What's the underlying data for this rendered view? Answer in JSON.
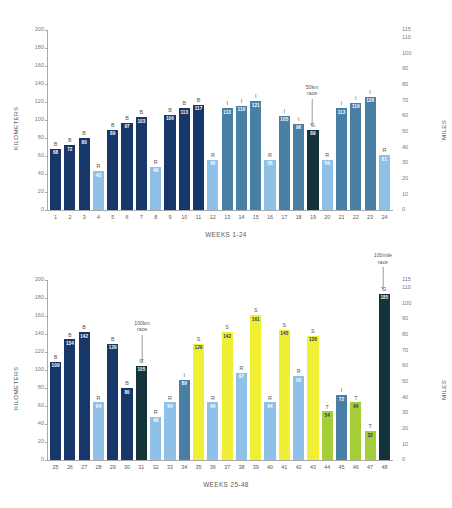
{
  "chart_data": [
    {
      "type": "bar",
      "id": "weeks-1-24",
      "title": "",
      "xlabel": "WEEKS 1-24",
      "ylabel": "KILOMETERS",
      "ylabel_right": "MILES",
      "ylim": [
        0,
        200
      ],
      "yticks": [
        0,
        20,
        40,
        60,
        80,
        100,
        120,
        140,
        160,
        180,
        200
      ],
      "ylim_right": [
        0,
        115
      ],
      "yticks_right": [
        0,
        10,
        20,
        30,
        40,
        50,
        60,
        70,
        80,
        90,
        100,
        110,
        115
      ],
      "grid": false,
      "legend": "none",
      "categories": [
        "1",
        "2",
        "3",
        "4",
        "5",
        "6",
        "7",
        "8",
        "9",
        "10",
        "11",
        "12",
        "13",
        "14",
        "15",
        "16",
        "17",
        "18",
        "19",
        "20",
        "21",
        "22",
        "23",
        "24"
      ],
      "values": [
        68,
        72,
        80,
        43,
        89,
        97,
        103,
        48,
        106,
        113,
        117,
        56,
        113,
        116,
        121,
        56,
        105,
        96,
        89,
        56,
        113,
        119,
        126,
        61
      ],
      "types": [
        "B",
        "B",
        "B",
        "R",
        "B",
        "B",
        "B",
        "R",
        "B",
        "B",
        "B",
        "R",
        "I",
        "I",
        "I",
        "R",
        "I",
        "I",
        "G",
        "R",
        "I",
        "I",
        "I",
        "R"
      ],
      "annotations": [
        {
          "text_line1": "50km",
          "text_line2": "race",
          "week": "19"
        }
      ]
    },
    {
      "type": "bar",
      "id": "weeks-25-48",
      "title": "",
      "xlabel": "WEEKS 25-48",
      "ylabel": "KILOMETERS",
      "ylabel_right": "MILES",
      "ylim": [
        0,
        200
      ],
      "yticks": [
        0,
        20,
        40,
        60,
        80,
        100,
        120,
        140,
        160,
        180,
        200
      ],
      "ylim_right": [
        0,
        115
      ],
      "yticks_right": [
        0,
        10,
        20,
        30,
        40,
        50,
        60,
        70,
        80,
        90,
        100,
        110,
        115
      ],
      "grid": false,
      "legend": "none",
      "categories": [
        "25",
        "26",
        "27",
        "28",
        "29",
        "30",
        "31",
        "32",
        "33",
        "34",
        "35",
        "36",
        "37",
        "38",
        "39",
        "40",
        "41",
        "42",
        "43",
        "44",
        "45",
        "46",
        "47",
        "48"
      ],
      "values": [
        109,
        134,
        142,
        64,
        129,
        80,
        105,
        48,
        64,
        89,
        129,
        64,
        142,
        97,
        161,
        64,
        145,
        93,
        138,
        54,
        72,
        64,
        32,
        185
      ],
      "types": [
        "B",
        "B",
        "B",
        "R",
        "B",
        "B",
        "G",
        "R",
        "R",
        "I",
        "S",
        "R",
        "S",
        "R",
        "S",
        "R",
        "S",
        "R",
        "S",
        "T",
        "I",
        "T",
        "T",
        "G"
      ],
      "annotations": [
        {
          "text_line1": "100km",
          "text_line2": "race",
          "week": "31"
        },
        {
          "text_line1": "100mile",
          "text_line2": "race",
          "week": "48"
        }
      ]
    }
  ],
  "colors": {
    "B": "#17376b",
    "R": "#8ec0e8",
    "I": "#4a7fa5",
    "G": "#13323a",
    "S": "#eff033",
    "T": "#a6ce39",
    "axis": "#a7a9ac",
    "text": "#58595b",
    "tick_text": "#7b7c7f",
    "value_light": "#ffffff",
    "value_dark": "#17376b"
  }
}
